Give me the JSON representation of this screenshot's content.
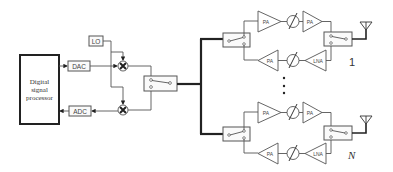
{
  "diagram": {
    "dsp": {
      "line1": "Digital",
      "line2": "signal",
      "line3": "processor"
    },
    "dac": "DAC",
    "adc": "ADC",
    "lo": "LO",
    "chains": [
      {
        "index_label": "1",
        "tx_amp1": "PA",
        "tx_amp2": "PA",
        "rx_amp1": "PA",
        "rx_amp2": "LNA"
      },
      {
        "index_label": "N",
        "tx_amp1": "PA",
        "tx_amp2": "PA",
        "rx_amp1": "PA",
        "rx_amp2": "LNA"
      }
    ],
    "ellipsis": "⋮"
  }
}
